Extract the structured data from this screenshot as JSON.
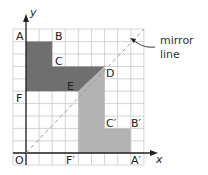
{
  "figure": {
    "axes": {
      "x_label": "x",
      "y_label": "y"
    },
    "grid": {
      "min": -1,
      "max": 9
    },
    "colors": {
      "dark_shape": "#6f6f6f",
      "light_shape": "#b3b3b3",
      "grid": "#c8c8c8",
      "axis": "#222222",
      "mirror_line": "#999999"
    },
    "points": [
      {
        "name": "A",
        "x": 0,
        "y": 8
      },
      {
        "name": "B",
        "x": 2,
        "y": 8
      },
      {
        "name": "C",
        "x": 2,
        "y": 6
      },
      {
        "name": "D",
        "x": 6,
        "y": 6
      },
      {
        "name": "E",
        "x": 4,
        "y": 4
      },
      {
        "name": "F",
        "x": 0,
        "y": 4
      },
      {
        "name": "O",
        "x": 0,
        "y": 0
      },
      {
        "name": "F′",
        "x": 4,
        "y": 0
      },
      {
        "name": "C′",
        "x": 6,
        "y": 2
      },
      {
        "name": "B′",
        "x": 8,
        "y": 2
      },
      {
        "name": "A′",
        "x": 8,
        "y": 0
      }
    ],
    "labels": {
      "A": "A",
      "B": "B",
      "C": "C",
      "D": "D",
      "E": "E",
      "F": "F",
      "O": "O",
      "F_prime": "F′",
      "C_prime": "C′",
      "B_prime": "B′",
      "A_prime": "A′",
      "x": "x",
      "y": "y"
    },
    "annotation": {
      "line1": "mirror",
      "line2": "line"
    }
  }
}
